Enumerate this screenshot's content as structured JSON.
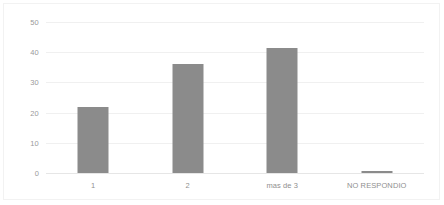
{
  "chart_data": {
    "type": "bar",
    "title": "",
    "subtitle": "",
    "xlabel": "",
    "ylabel": "",
    "categories": [
      "1",
      "2",
      "mas de 3",
      "NO RESPONDIO"
    ],
    "values": [
      22,
      36,
      41.5,
      0.3
    ],
    "series": [
      {
        "name": "",
        "values": [
          22,
          36,
          41.5,
          0.3
        ]
      }
    ],
    "ylim": [
      0,
      50
    ],
    "yticks": [
      0,
      10,
      20,
      30,
      40,
      50
    ],
    "ytick_labels": [
      "0",
      "10",
      "20",
      "30",
      "40",
      "50"
    ],
    "grid": true,
    "grid_axis": "y",
    "legend": false,
    "legend_position": "none",
    "bar_color": "#8b8b8b",
    "grid_color": "#f0f0f0",
    "axis_text_color": "#9a9a9a",
    "background_color": "#ffffff",
    "annotations": []
  }
}
